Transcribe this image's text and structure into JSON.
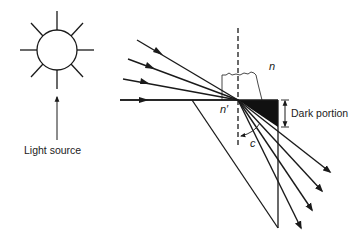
{
  "diagram": {
    "labels": {
      "light_source": "Light source",
      "dark_portion": "Dark portion",
      "sample_index": "n",
      "prism_index": "n′",
      "critical_angle": "c"
    },
    "colors": {
      "ink": "#1a1a1a",
      "dark_region": "#111111",
      "background": "#ffffff"
    },
    "elements": {
      "light_source_icon": "sun-icon",
      "incident_ray_count": 4,
      "refracted_ray_count": 4
    }
  }
}
